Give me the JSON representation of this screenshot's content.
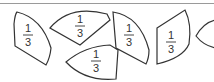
{
  "diagram": {
    "line_color": "#333333",
    "top_rule_color": "#9a9a9a",
    "pieces": [
      {
        "id": 1,
        "numerator": "1",
        "denominator": "3"
      },
      {
        "id": 2,
        "numerator": "1",
        "denominator": "3"
      },
      {
        "id": 3,
        "numerator": "1",
        "denominator": "3"
      },
      {
        "id": 4,
        "numerator": "1",
        "denominator": "3"
      },
      {
        "id": 5,
        "numerator": "1",
        "denominator": "3"
      },
      {
        "id": 6,
        "numerator": "",
        "denominator": ""
      }
    ]
  }
}
